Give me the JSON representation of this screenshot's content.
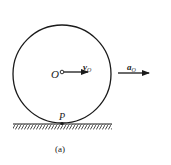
{
  "diagram": {
    "labels": {
      "center": "O",
      "velocity_main": "v",
      "velocity_sub": "O",
      "accel_main": "a",
      "accel_sub": "O",
      "contact_point": "P",
      "caption": "(a)"
    },
    "colors": {
      "stroke": "#1a1a1a",
      "background": "#ffffff"
    }
  }
}
